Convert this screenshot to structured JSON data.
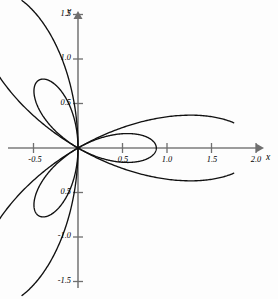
{
  "figure": {
    "background_color": "#fdfdfd",
    "curve_color": "#111111",
    "axis_color": "#7b7b7b",
    "width": 278,
    "height": 299
  },
  "axes": {
    "x_label": "x",
    "y_label": "y",
    "origin_px": {
      "x": 78,
      "y": 148
    },
    "scale_px_per_unit": 89,
    "x_axis_start_px": 8,
    "x_axis_end_px": 263,
    "y_axis_top_px": 12,
    "y_axis_bottom_px": 288
  },
  "x_ticks": [
    {
      "value": -0.5,
      "label": "-0.5"
    },
    {
      "value": 0.5,
      "label": "0.5"
    },
    {
      "value": 1.0,
      "label": "1.0"
    },
    {
      "value": 1.5,
      "label": "1.5"
    },
    {
      "value": 2.0,
      "label": "2.0"
    }
  ],
  "y_ticks": [
    {
      "value": 1.5,
      "label": "1.5"
    },
    {
      "value": 1.0,
      "label": "1.0"
    },
    {
      "value": 0.5,
      "label": "0.5"
    },
    {
      "value": -0.5,
      "label": "0.5"
    },
    {
      "value": -1.0,
      "label": "-1.0"
    },
    {
      "value": -1.5,
      "label": "-1.5"
    }
  ],
  "chart_data": {
    "type": "line",
    "title": "",
    "xlabel": "x",
    "ylabel": "y",
    "coordinate_system": "polar",
    "grid": false,
    "legend": false,
    "xlim": [
      -0.8,
      2.15
    ],
    "ylim": [
      -1.7,
      1.7
    ],
    "x_ticks": [
      -0.5,
      0.5,
      1.0,
      1.5,
      2.0
    ],
    "y_ticks": [
      -1.5,
      -1.0,
      -0.5,
      0.5,
      1.0,
      1.5
    ],
    "series": [
      {
        "name": "outer-rose",
        "equation": "r = 2*cos(3*theta)",
        "petal_count": 3,
        "max_radius": 2.0,
        "petal_tip_angles_deg": [
          0,
          120,
          240
        ],
        "petal_tips": [
          {
            "x": 2.0,
            "y": 0.0
          },
          {
            "x": -1.0,
            "y": 1.73
          },
          {
            "x": -1.0,
            "y": -1.73
          }
        ],
        "note": "large petals; upper-left and lower-left petals clipped by figure frame near radius 1.75"
      },
      {
        "name": "inner-rose",
        "equation": "r = 0.88*cos(3*theta)",
        "petal_count": 3,
        "max_radius": 0.88,
        "petal_tip_angles_deg": [
          120,
          240,
          0
        ],
        "petal_tips": [
          {
            "x": -0.44,
            "y": 0.76
          },
          {
            "x": -0.44,
            "y": -0.76
          },
          {
            "x": 0.88,
            "y": 0.0
          }
        ],
        "note": "smaller inner petals visible only in upper-left and lower-left quadrants"
      }
    ],
    "annotations": []
  }
}
